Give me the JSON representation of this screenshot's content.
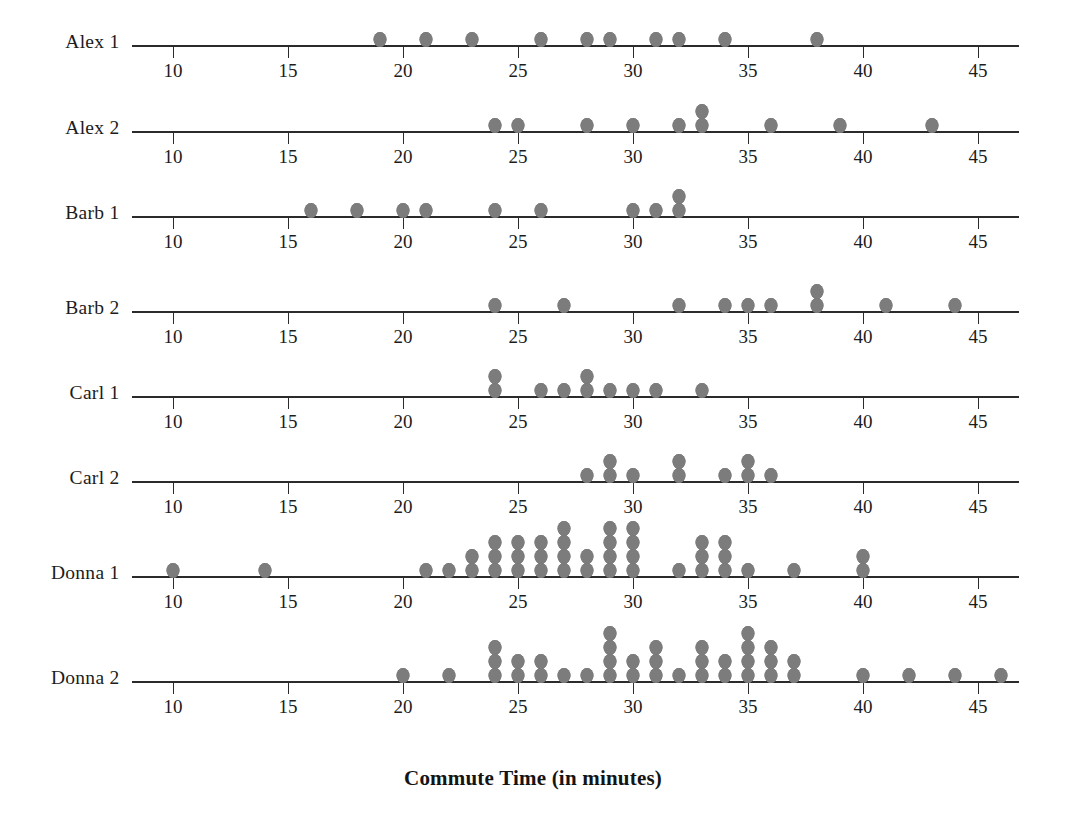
{
  "chart_data": {
    "type": "scatter",
    "title": "",
    "xlabel": "Commute Time (in minutes)",
    "ylabel": "",
    "xlim": [
      8.2,
      46.8
    ],
    "xticks": [
      10,
      15,
      20,
      25,
      30,
      35,
      40,
      45
    ],
    "xtick_labels": [
      "10",
      "15",
      "20",
      "25",
      "30",
      "35",
      "40",
      "45"
    ],
    "grid": false,
    "legend": null,
    "dot_color": "#7c7c7c",
    "axis_color": "#2b2b2b",
    "series": [
      {
        "name": "Alex 1",
        "values": [
          19,
          21,
          23,
          26,
          28,
          29,
          31,
          32,
          34,
          38
        ],
        "stacks": [
          {
            "x": 19,
            "count": 1
          },
          {
            "x": 21,
            "count": 1
          },
          {
            "x": 23,
            "count": 1
          },
          {
            "x": 26,
            "count": 1
          },
          {
            "x": 28,
            "count": 1
          },
          {
            "x": 29,
            "count": 1
          },
          {
            "x": 31,
            "count": 1
          },
          {
            "x": 32,
            "count": 1
          },
          {
            "x": 34,
            "count": 1
          },
          {
            "x": 38,
            "count": 1
          }
        ]
      },
      {
        "name": "Alex 2",
        "values": [
          24,
          25,
          28,
          30,
          32,
          33,
          33,
          36,
          39,
          43
        ],
        "stacks": [
          {
            "x": 24,
            "count": 1
          },
          {
            "x": 25,
            "count": 1
          },
          {
            "x": 28,
            "count": 1
          },
          {
            "x": 30,
            "count": 1
          },
          {
            "x": 32,
            "count": 1
          },
          {
            "x": 33,
            "count": 2
          },
          {
            "x": 36,
            "count": 1
          },
          {
            "x": 39,
            "count": 1
          },
          {
            "x": 43,
            "count": 1
          }
        ]
      },
      {
        "name": "Barb 1",
        "values": [
          16,
          18,
          20,
          21,
          24,
          26,
          30,
          31,
          32,
          32
        ],
        "stacks": [
          {
            "x": 16,
            "count": 1
          },
          {
            "x": 18,
            "count": 1
          },
          {
            "x": 20,
            "count": 1
          },
          {
            "x": 21,
            "count": 1
          },
          {
            "x": 24,
            "count": 1
          },
          {
            "x": 26,
            "count": 1
          },
          {
            "x": 30,
            "count": 1
          },
          {
            "x": 31,
            "count": 1
          },
          {
            "x": 32,
            "count": 2
          }
        ]
      },
      {
        "name": "Barb 2",
        "values": [
          24,
          27,
          32,
          34,
          35,
          36,
          38,
          38,
          41,
          44
        ],
        "stacks": [
          {
            "x": 24,
            "count": 1
          },
          {
            "x": 27,
            "count": 1
          },
          {
            "x": 32,
            "count": 1
          },
          {
            "x": 34,
            "count": 1
          },
          {
            "x": 35,
            "count": 1
          },
          {
            "x": 36,
            "count": 1
          },
          {
            "x": 38,
            "count": 2
          },
          {
            "x": 41,
            "count": 1
          },
          {
            "x": 44,
            "count": 1
          }
        ]
      },
      {
        "name": "Carl 1",
        "values": [
          24,
          24,
          26,
          27,
          28,
          28,
          29,
          30,
          31,
          33
        ],
        "stacks": [
          {
            "x": 24,
            "count": 2
          },
          {
            "x": 26,
            "count": 1
          },
          {
            "x": 27,
            "count": 1
          },
          {
            "x": 28,
            "count": 2
          },
          {
            "x": 29,
            "count": 1
          },
          {
            "x": 30,
            "count": 1
          },
          {
            "x": 31,
            "count": 1
          },
          {
            "x": 33,
            "count": 1
          }
        ]
      },
      {
        "name": "Carl 2",
        "values": [
          28,
          29,
          29,
          30,
          32,
          32,
          34,
          35,
          35,
          36
        ],
        "stacks": [
          {
            "x": 28,
            "count": 1
          },
          {
            "x": 29,
            "count": 2
          },
          {
            "x": 30,
            "count": 1
          },
          {
            "x": 32,
            "count": 2
          },
          {
            "x": 34,
            "count": 1
          },
          {
            "x": 35,
            "count": 2
          },
          {
            "x": 36,
            "count": 1
          }
        ]
      },
      {
        "name": "Donna 1",
        "values": [
          10,
          14,
          21,
          22,
          23,
          23,
          24,
          24,
          24,
          25,
          25,
          25,
          26,
          26,
          26,
          27,
          27,
          27,
          27,
          28,
          28,
          29,
          29,
          29,
          29,
          30,
          30,
          30,
          30,
          32,
          33,
          33,
          33,
          34,
          34,
          34,
          35,
          37,
          40,
          40
        ],
        "stacks": [
          {
            "x": 10,
            "count": 1
          },
          {
            "x": 14,
            "count": 1
          },
          {
            "x": 21,
            "count": 1
          },
          {
            "x": 22,
            "count": 1
          },
          {
            "x": 23,
            "count": 2
          },
          {
            "x": 24,
            "count": 3
          },
          {
            "x": 25,
            "count": 3
          },
          {
            "x": 26,
            "count": 3
          },
          {
            "x": 27,
            "count": 4
          },
          {
            "x": 28,
            "count": 2
          },
          {
            "x": 29,
            "count": 4
          },
          {
            "x": 30,
            "count": 4
          },
          {
            "x": 32,
            "count": 1
          },
          {
            "x": 33,
            "count": 3
          },
          {
            "x": 34,
            "count": 3
          },
          {
            "x": 35,
            "count": 1
          },
          {
            "x": 37,
            "count": 1
          },
          {
            "x": 40,
            "count": 2
          }
        ]
      },
      {
        "name": "Donna 2",
        "values": [
          20,
          22,
          24,
          24,
          24,
          25,
          25,
          26,
          26,
          27,
          28,
          29,
          29,
          29,
          29,
          30,
          30,
          31,
          31,
          31,
          32,
          33,
          33,
          33,
          34,
          34,
          35,
          35,
          35,
          35,
          36,
          36,
          36,
          37,
          37,
          40,
          42,
          44,
          46
        ],
        "stacks": [
          {
            "x": 20,
            "count": 1
          },
          {
            "x": 22,
            "count": 1
          },
          {
            "x": 24,
            "count": 3
          },
          {
            "x": 25,
            "count": 2
          },
          {
            "x": 26,
            "count": 2
          },
          {
            "x": 27,
            "count": 1
          },
          {
            "x": 28,
            "count": 1
          },
          {
            "x": 29,
            "count": 4
          },
          {
            "x": 30,
            "count": 2
          },
          {
            "x": 31,
            "count": 3
          },
          {
            "x": 32,
            "count": 1
          },
          {
            "x": 33,
            "count": 3
          },
          {
            "x": 34,
            "count": 2
          },
          {
            "x": 35,
            "count": 4
          },
          {
            "x": 36,
            "count": 3
          },
          {
            "x": 37,
            "count": 2
          },
          {
            "x": 40,
            "count": 1
          },
          {
            "x": 42,
            "count": 1
          },
          {
            "x": 44,
            "count": 1
          },
          {
            "x": 46,
            "count": 1
          }
        ]
      }
    ]
  },
  "axis_title": "Commute Time (in minutes)"
}
